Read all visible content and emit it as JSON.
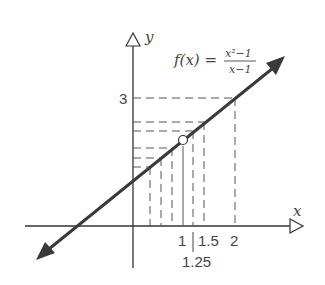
{
  "diagram": {
    "function_label": "f(x) =",
    "numerator": "x²−1",
    "denominator": "x−1",
    "x_axis_label": "x",
    "y_axis_label": "y",
    "y_tick_label": "3",
    "x_tick_labels": {
      "one": "1",
      "one_point_five": "1.5",
      "two": "2",
      "one_point_two_five": "1.25"
    },
    "line_color": "#3a3a3a",
    "axis_color": "#333333",
    "dash_color": "#555555",
    "hole_point": "(1, 2)"
  }
}
